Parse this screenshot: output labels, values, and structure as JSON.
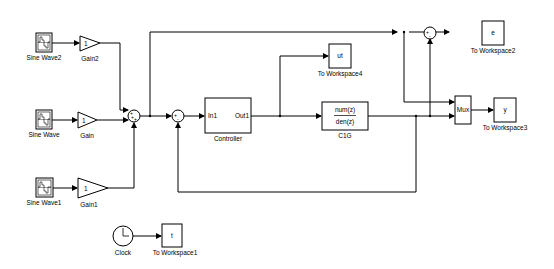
{
  "diagram": {
    "blocks": {
      "sine_wave2": {
        "label": "Sine Wave2"
      },
      "sine_wave": {
        "label": "Sine Wave"
      },
      "sine_wave1": {
        "label": "Sine Wave1"
      },
      "gain2": {
        "label": "Gain2",
        "value": "1"
      },
      "gain": {
        "label": "Gain",
        "value": "1"
      },
      "gain1": {
        "label": "Gain1",
        "value": "1"
      },
      "sum1": {
        "signs": [
          "+",
          "+",
          "+"
        ]
      },
      "sum2": {
        "signs": [
          "+",
          "-"
        ]
      },
      "sum3": {
        "signs": [
          "+",
          "-"
        ]
      },
      "controller": {
        "label": "Controller",
        "in_port": "In1",
        "out_port": "Out1"
      },
      "c1g": {
        "label": "C1G",
        "num": "num(z)",
        "den": "den(z)"
      },
      "ws4": {
        "label": "To Workspace4",
        "var": "ut"
      },
      "ws2": {
        "label": "To Workspace2",
        "var": "e"
      },
      "mux": {
        "label": "Mux"
      },
      "ws3": {
        "label": "To Workspace3",
        "var": "y"
      },
      "clock": {
        "label": "Clock"
      },
      "ws1": {
        "label": "To Workspace1",
        "var": "t"
      }
    }
  }
}
